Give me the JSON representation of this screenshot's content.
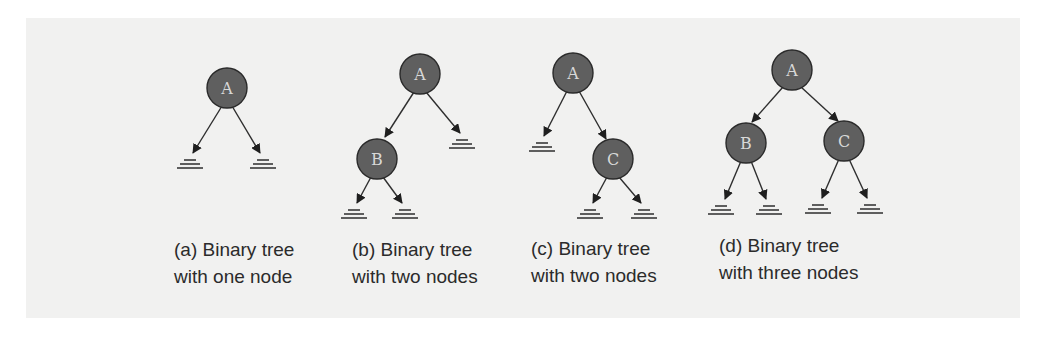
{
  "figure": {
    "panels": [
      {
        "id": "a",
        "caption_line1": "(a) Binary tree",
        "caption_line2": "with one node",
        "nodes": [
          {
            "label": "A",
            "x": 227,
            "y": 88
          }
        ],
        "edges": [
          {
            "from": [
              227,
              88
            ],
            "to": [
              190,
              160
            ],
            "target": "null"
          },
          {
            "from": [
              227,
              88
            ],
            "to": [
              263,
              160
            ],
            "target": "null"
          }
        ],
        "null_links": [
          {
            "x": 190,
            "y": 160
          },
          {
            "x": 263,
            "y": 160
          }
        ]
      },
      {
        "id": "b",
        "caption_line1": "(b) Binary tree",
        "caption_line2": "with two nodes",
        "nodes": [
          {
            "label": "A",
            "x": 420,
            "y": 74
          },
          {
            "label": "B",
            "x": 377,
            "y": 159
          }
        ],
        "null_links": [
          {
            "x": 462,
            "y": 139
          },
          {
            "x": 354,
            "y": 210
          },
          {
            "x": 405,
            "y": 210
          }
        ]
      },
      {
        "id": "c",
        "caption_line1": "(c) Binary tree",
        "caption_line2": "with two nodes",
        "nodes": [
          {
            "label": "A",
            "x": 573,
            "y": 73
          },
          {
            "label": "C",
            "x": 613,
            "y": 159
          }
        ],
        "null_links": [
          {
            "x": 542,
            "y": 143
          },
          {
            "x": 590,
            "y": 210
          },
          {
            "x": 644,
            "y": 210
          }
        ]
      },
      {
        "id": "d",
        "caption_line1": "(d) Binary tree",
        "caption_line2": "with three nodes",
        "nodes": [
          {
            "label": "A",
            "x": 792,
            "y": 70
          },
          {
            "label": "B",
            "x": 746,
            "y": 143
          },
          {
            "label": "C",
            "x": 844,
            "y": 141
          }
        ],
        "null_links": [
          {
            "x": 721,
            "y": 206
          },
          {
            "x": 769,
            "y": 206
          },
          {
            "x": 818,
            "y": 205
          },
          {
            "x": 870,
            "y": 205
          }
        ]
      }
    ],
    "colors": {
      "page_background": "#f1f1f0",
      "node_fill": "#5f5f5f",
      "node_label": "#d8d8d8",
      "edge": "#2e2e2e",
      "caption_text": "#2b2b2b"
    }
  }
}
